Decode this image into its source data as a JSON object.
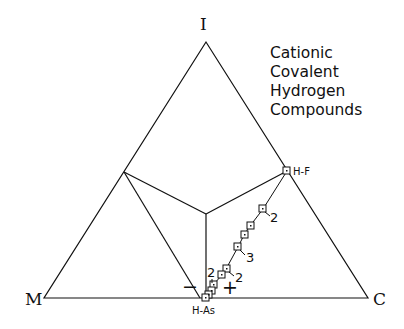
{
  "diagram": {
    "title_lines": [
      "Cationic",
      "Covalent",
      "Hydrogen",
      "Compounds"
    ],
    "vertices": {
      "top": "I",
      "left": "M",
      "right": "C"
    },
    "points": {
      "top_point": "H-F",
      "bottom_point": "H-As"
    },
    "series_labels": [
      "2",
      "3",
      "2",
      "2"
    ],
    "signs": {
      "minus": "−",
      "plus": "+"
    },
    "colors": {
      "line": "#111111",
      "background": "#ffffff"
    }
  }
}
